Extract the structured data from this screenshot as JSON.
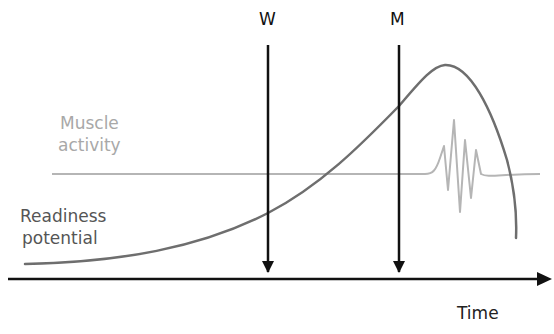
{
  "diagram": {
    "markers": [
      {
        "label": "W",
        "x": 268
      },
      {
        "label": "M",
        "x": 399
      }
    ],
    "muscle_activity": {
      "label_line1": "Muscle",
      "label_line2": "activity",
      "color": "#b0b0b0"
    },
    "readiness_potential": {
      "label_line1": "Readiness",
      "label_line2": "potential",
      "color": "#6e6e6e"
    },
    "x_axis": {
      "label": "Time"
    },
    "colors": {
      "axis": "#111111",
      "arrows": "#111111",
      "rp_curve": "#6e6e6e",
      "emg": "#b5b5b5",
      "background": "#ffffff"
    }
  }
}
